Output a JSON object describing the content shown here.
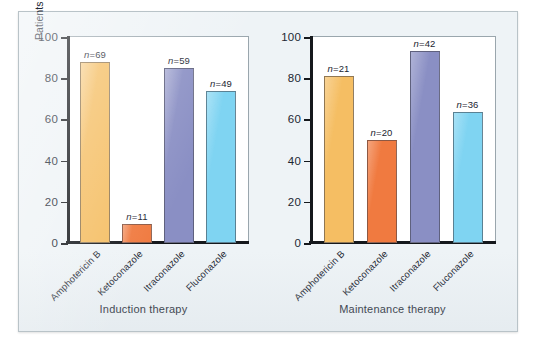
{
  "chart_data": {
    "type": "bar",
    "title": "",
    "xlabel": "",
    "ylabel": "Patients with AIDS responding to therapy, %",
    "ylabel_line1": "Patients with AIDS responding",
    "ylabel_line2": "to therapy, %",
    "ylim": [
      0,
      100
    ],
    "yticks": [
      0,
      20,
      40,
      60,
      80,
      100
    ],
    "ytick_labels": [
      "0",
      "20",
      "40",
      "60",
      "80",
      "100"
    ],
    "grid": false,
    "legend": "none",
    "categories": [
      "Amphotericin B",
      "Ketoconazole",
      "Itraconazole",
      "Fluconazole"
    ],
    "panels": [
      {
        "caption": "Induction therapy",
        "values": [
          88,
          9,
          85,
          74
        ],
        "annotations": [
          "n=69",
          "n=11",
          "n=59",
          "n=49"
        ],
        "n": [
          69,
          11,
          59,
          49
        ]
      },
      {
        "caption": "Maintenance therapy",
        "values": [
          81,
          50,
          93,
          63.5
        ],
        "annotations": [
          "n=21",
          "n=20",
          "n=42",
          "n=36"
        ],
        "n": [
          21,
          20,
          42,
          36
        ]
      }
    ],
    "series_colors": [
      "#F5BE63",
      "#F07A40",
      "#8A8FC4",
      "#7FD4F2"
    ]
  },
  "colors": {
    "amphotericin_b": "#F5BE63",
    "ketoconazole": "#F07A40",
    "itraconazole": "#8A8FC4",
    "fluconazole": "#7FD4F2",
    "figure_background": "#EEF3F6",
    "plot_background": "#FFFFFF",
    "axis": "#15181C",
    "text": "#1C2733"
  }
}
